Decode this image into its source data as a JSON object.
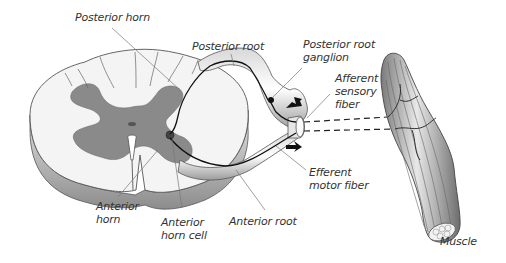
{
  "diagram": {
    "colors": {
      "white_matter": "#f4f4f4",
      "gray_matter": "#8a8a8a",
      "outline": "#555555",
      "nerve_fiber": "#111111",
      "leader_line": "#777777",
      "muscle": "#9a9a9a",
      "label_text": "#333333"
    },
    "labels": {
      "posterior_horn": "Posterior horn",
      "posterior_root": "Posterior root",
      "posterior_root_ganglion": "Posterior root\nganglion",
      "afferent_sensory_fiber": "Afferent\nsensory\nfiber",
      "efferent_motor_fiber": "Efferent\nmotor fiber",
      "anterior_horn": "Anterior\nhorn",
      "anterior_horn_cell": "Anterior\nhorn cell",
      "anterior_root": "Anterior root",
      "muscle": "Muscle"
    },
    "arrows": [
      {
        "name": "afferent-direction",
        "direction": "toward spinal cord (up-left)"
      },
      {
        "name": "efferent-direction",
        "direction": "toward muscle (right)"
      }
    ]
  }
}
